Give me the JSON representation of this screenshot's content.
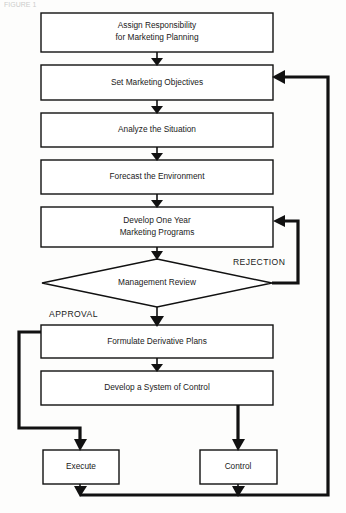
{
  "figure": {
    "caption_fragment": "FIGURE 1"
  },
  "nodes": [
    {
      "id": "assign-responsibility",
      "shape": "process",
      "lines": [
        "Assign Responsibility",
        "for Marketing Planning"
      ]
    },
    {
      "id": "set-marketing-objectives",
      "shape": "process",
      "lines": [
        "Set Marketing Objectives"
      ]
    },
    {
      "id": "analyze-the-situation",
      "shape": "process",
      "lines": [
        "Analyze the Situation"
      ]
    },
    {
      "id": "forecast-the-environment",
      "shape": "process",
      "lines": [
        "Forecast the Environment"
      ]
    },
    {
      "id": "develop-one-year-marketing-programs",
      "shape": "process",
      "lines": [
        "Develop One Year",
        "Marketing Programs"
      ]
    },
    {
      "id": "management-review",
      "shape": "decision",
      "lines": [
        "Management Review"
      ]
    },
    {
      "id": "formulate-derivative-plans",
      "shape": "process",
      "lines": [
        "Formulate Derivative Plans"
      ]
    },
    {
      "id": "develop-a-system-of-control",
      "shape": "process",
      "lines": [
        "Develop a System of Control"
      ]
    },
    {
      "id": "execute",
      "shape": "process",
      "lines": [
        "Execute"
      ]
    },
    {
      "id": "control",
      "shape": "process",
      "lines": [
        "Control"
      ]
    }
  ],
  "branch_labels": {
    "rejection": "REJECTION",
    "approval": "APPROVAL"
  },
  "colors": {
    "line": "#111111",
    "box_fill": "#ffffff",
    "page_background": "#fdfdfc",
    "text": "#1a1a1a"
  }
}
